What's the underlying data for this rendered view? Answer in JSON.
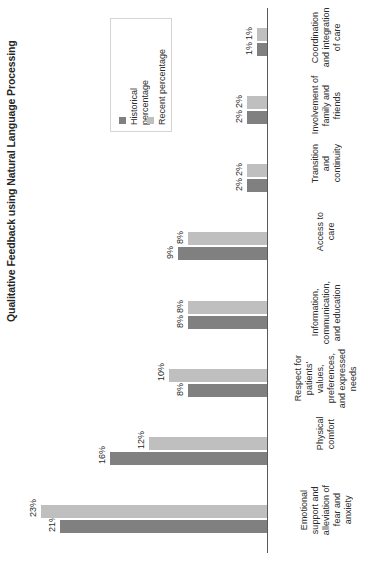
{
  "chart_data": {
    "type": "bar",
    "title": "Qualitative Feedback using Natural Language Processing",
    "xlabel": "",
    "ylabel": "",
    "orientation": "horizontal-rotated",
    "grid": false,
    "legend_position": "top-left",
    "value_suffix": "%",
    "xlim": [
      0,
      25
    ],
    "categories": [
      "Emotional\nsupport and\nalleviation of\nfear and\nanxiety",
      "Physical\ncomfort",
      "Respect for\npatients'\nvalues,\npreferences,\nand expressed\nneeds",
      "Information,\ncommunication,\nand education",
      "Access to\ncare",
      "Transition\nand\ncontinuity",
      "Involvement of\nfamily and\nfriends",
      "Coordination\nand integration\nof care"
    ],
    "series": [
      {
        "name": "Historical\npercentage",
        "color": "#808080",
        "values": [
          21,
          16,
          8,
          8,
          9,
          2,
          2,
          1
        ],
        "labels": [
          "21%",
          "16%",
          "8%",
          "8%",
          "9%",
          "2%",
          "2%",
          "1%"
        ]
      },
      {
        "name": "Recent percentage",
        "color": "#bfbfbf",
        "values": [
          23,
          12,
          10,
          8,
          8,
          2,
          2,
          1
        ],
        "labels": [
          "23%",
          "12%",
          "10%",
          "8%",
          "8%",
          "2%",
          "2%",
          "1%"
        ]
      }
    ]
  },
  "legend": {
    "items": [
      {
        "label": "Historical\npercentage",
        "color": "#808080",
        "marker": "square-swatch"
      },
      {
        "label": "Recent percentage",
        "color": "#bfbfbf",
        "marker": "square-swatch"
      }
    ]
  }
}
